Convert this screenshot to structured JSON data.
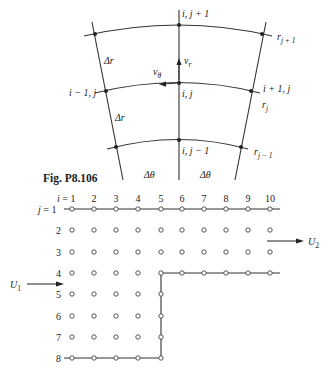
{
  "top_figure": {
    "nodes": {
      "top_center": "i, j + 1",
      "center": "i, j",
      "bottom_center": "i, j − 1",
      "left_center": "i − 1, j",
      "right_center": "i + 1, j"
    },
    "radii": {
      "outer": "r",
      "outer_sub": "j + 1",
      "middle": "r",
      "middle_sub": "j",
      "inner": "r",
      "inner_sub": "j − 1"
    },
    "velocities": {
      "radial": "v",
      "radial_sub": "r",
      "tangential": "v",
      "tangential_sub": "θ"
    },
    "spacings": {
      "delta_r_upper": "Δr",
      "delta_r_lower": "Δr",
      "delta_theta_left": "Δθ",
      "delta_theta_right": "Δθ"
    }
  },
  "caption": "Fig. P8.106",
  "grid_figure": {
    "i_prefix": "i = 1",
    "j_prefix": "j = 1",
    "columns": [
      "2",
      "3",
      "4",
      "5",
      "6",
      "7",
      "8",
      "9",
      "10"
    ],
    "rows": [
      "2",
      "3",
      "4",
      "5",
      "6",
      "7",
      "8"
    ],
    "inlet_label": "U",
    "inlet_sub": "1",
    "outlet_label": "U",
    "outlet_sub": "2"
  }
}
